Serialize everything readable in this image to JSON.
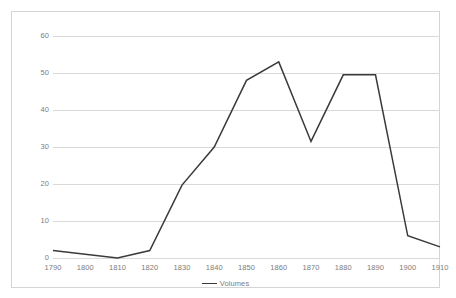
{
  "chart_data": {
    "type": "line",
    "title": "",
    "xlabel": "",
    "ylabel": "",
    "categories": [
      "1790",
      "1800",
      "1810",
      "1820",
      "1830",
      "1840",
      "1850",
      "1860",
      "1870",
      "1880",
      "1890",
      "1900",
      "1910"
    ],
    "series": [
      {
        "name": "Volumes",
        "color": "#3a3a3a",
        "values": [
          2,
          1,
          0,
          2,
          19.7,
          30,
          48,
          53,
          31.5,
          49.5,
          49.5,
          6,
          3
        ]
      }
    ],
    "ylim": [
      0,
      60
    ],
    "yticks": [
      0,
      10,
      20,
      30,
      40,
      50,
      60
    ],
    "ytick_labels": [
      "0",
      "10",
      "20",
      "30",
      "40",
      "50",
      "60"
    ],
    "grid": true,
    "grid_axis": "y",
    "grid_color": "#d9d9d9",
    "legend": {
      "position": "bottom-center",
      "entries": [
        "Volumes"
      ]
    },
    "background_color": "#ffffff",
    "border_color": "#d4d4d4",
    "tick_label_color": "#7d7d7d"
  }
}
